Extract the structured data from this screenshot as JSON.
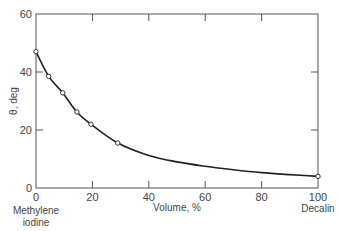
{
  "chart_data": {
    "type": "line",
    "title": "",
    "xlabel": "Volume, %",
    "ylabel": "θ, deg",
    "xlim": [
      0,
      100
    ],
    "ylim": [
      0,
      60
    ],
    "x_ticks": [
      0,
      20,
      40,
      60,
      80,
      100
    ],
    "y_ticks": [
      0,
      20,
      40,
      60
    ],
    "x_end_labels": {
      "left": [
        "Methylene",
        "iodine"
      ],
      "right": [
        "Decalin"
      ]
    },
    "grid": false,
    "legend": null,
    "series": [
      {
        "name": "measured",
        "marker": "open-circle",
        "x": [
          0,
          4.5,
          9.5,
          14.5,
          19.5,
          29,
          100
        ],
        "y": [
          47,
          38.5,
          32.8,
          26.2,
          22,
          15.5,
          4
        ]
      }
    ],
    "fit_curve": {
      "x": [
        0,
        4.5,
        9.5,
        14.5,
        19.5,
        29,
        40,
        50,
        60,
        70,
        80,
        90,
        100
      ],
      "y": [
        47,
        38.5,
        32.8,
        26.2,
        22,
        15.5,
        11.2,
        9,
        7.5,
        6.3,
        5.3,
        4.6,
        4
      ]
    }
  }
}
